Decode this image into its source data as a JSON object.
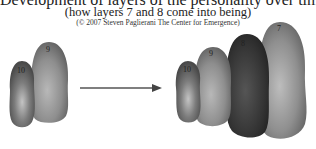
{
  "header": {
    "title_partial": "Development of layers of the personality over time in response",
    "subtitle": "(how layers 7 and 8 come into being)",
    "copyright": "(© 2007 Steven Paglierani   The Center for Emergence)"
  },
  "before": {
    "layers": [
      {
        "label": "9",
        "color": "#8f8f8f"
      },
      {
        "label": "10",
        "color": "#7a7a7a"
      }
    ]
  },
  "after": {
    "layers": [
      {
        "label": "7",
        "color": "#8d8d8d"
      },
      {
        "label": "8",
        "color": "#3a3a3a"
      },
      {
        "label": "9",
        "color": "#868686"
      },
      {
        "label": "10",
        "color": "#7a7a7a"
      }
    ]
  },
  "arrow": {
    "icon": "right-arrow-icon",
    "color": "#555555"
  }
}
